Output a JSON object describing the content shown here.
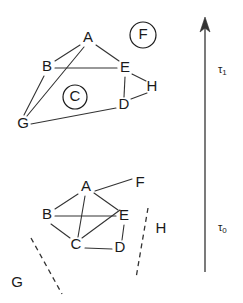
{
  "figure": {
    "type": "graph-evolution-diagram",
    "width": 243,
    "height": 303,
    "background_color": "#ffffff",
    "line_color": "#333333",
    "text_color": "#1a1a1a"
  },
  "time_axis": {
    "direction": "upward",
    "arrow_x": 205,
    "arrow_top_y": 22,
    "arrow_bottom_y": 272,
    "labels": [
      {
        "id": "tau1",
        "base": "τ",
        "subscript": "1",
        "text": "τ1",
        "x": 220,
        "y": 70
      },
      {
        "id": "tau0",
        "base": "τ",
        "subscript": "0",
        "text": "τ0",
        "x": 220,
        "y": 228
      }
    ]
  },
  "graphs": [
    {
      "id": "graph-tau1",
      "time_label": "τ1",
      "position": "upper",
      "nodes": [
        {
          "id": "A",
          "label": "A",
          "x": 88,
          "y": 38,
          "circled": false
        },
        {
          "id": "B",
          "label": "B",
          "x": 47,
          "y": 67,
          "circled": false
        },
        {
          "id": "E",
          "label": "E",
          "x": 125,
          "y": 68,
          "circled": false
        },
        {
          "id": "H",
          "label": "H",
          "x": 152,
          "y": 87,
          "circled": false
        },
        {
          "id": "D",
          "label": "D",
          "x": 124,
          "y": 105,
          "circled": false
        },
        {
          "id": "G",
          "label": "G",
          "x": 23,
          "y": 124,
          "circled": false
        },
        {
          "id": "C",
          "label": "C",
          "x": 75,
          "y": 97,
          "circled": true,
          "ring_r": 12
        },
        {
          "id": "F",
          "label": "F",
          "x": 143,
          "y": 35,
          "circled": true,
          "ring_r": 13
        }
      ],
      "edges": [
        {
          "from": "A",
          "to": "B"
        },
        {
          "from": "A",
          "to": "E"
        },
        {
          "from": "A",
          "to": "G"
        },
        {
          "from": "B",
          "to": "E"
        },
        {
          "from": "B",
          "to": "G"
        },
        {
          "from": "E",
          "to": "H"
        },
        {
          "from": "E",
          "to": "D"
        },
        {
          "from": "D",
          "to": "H"
        },
        {
          "from": "D",
          "to": "G"
        }
      ],
      "isolated_nodes": [
        "C",
        "F"
      ],
      "dashed_edges": []
    },
    {
      "id": "graph-tau0",
      "time_label": "τ0",
      "position": "lower",
      "nodes": [
        {
          "id": "A",
          "label": "A",
          "x": 86,
          "y": 187,
          "circled": false
        },
        {
          "id": "F",
          "label": "F",
          "x": 140,
          "y": 183,
          "circled": false
        },
        {
          "id": "B",
          "label": "B",
          "x": 47,
          "y": 215,
          "circled": false
        },
        {
          "id": "E",
          "label": "E",
          "x": 124,
          "y": 216,
          "circled": false
        },
        {
          "id": "C",
          "label": "C",
          "x": 76,
          "y": 245,
          "circled": false
        },
        {
          "id": "D",
          "label": "D",
          "x": 120,
          "y": 248,
          "circled": false
        },
        {
          "id": "H",
          "label": "H",
          "x": 161,
          "y": 229,
          "circled": false
        },
        {
          "id": "G",
          "label": "G",
          "x": 17,
          "y": 283,
          "circled": false
        }
      ],
      "edges": [
        {
          "from": "A",
          "to": "B"
        },
        {
          "from": "A",
          "to": "E"
        },
        {
          "from": "A",
          "to": "F"
        },
        {
          "from": "A",
          "to": "C"
        },
        {
          "from": "B",
          "to": "E"
        },
        {
          "from": "B",
          "to": "C"
        },
        {
          "from": "C",
          "to": "E"
        },
        {
          "from": "C",
          "to": "D"
        },
        {
          "from": "D",
          "to": "E"
        }
      ],
      "dashed_edges": [
        {
          "id": "dashed-left-boundary",
          "x1": 31,
          "y1": 238,
          "x2": 62,
          "y2": 294
        },
        {
          "id": "dashed-right-boundary",
          "x1": 148,
          "y1": 208,
          "x2": 136,
          "y2": 278
        }
      ]
    }
  ]
}
